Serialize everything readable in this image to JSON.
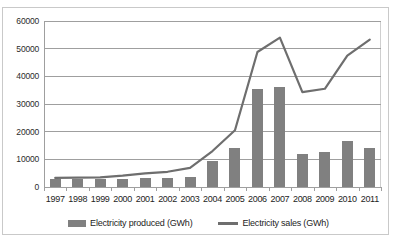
{
  "chart_data": {
    "type": "bar",
    "title": "",
    "xlabel": "",
    "ylabel": "",
    "ylim": [
      0,
      60000
    ],
    "ytick_step": 10000,
    "yticks": [
      "0",
      "10000",
      "20000",
      "30000",
      "40000",
      "50000",
      "60000"
    ],
    "grid": true,
    "legend_position": "bottom",
    "categories": [
      "1997",
      "1998",
      "1999",
      "2000",
      "2001",
      "2002",
      "2003",
      "2004",
      "2005",
      "2006",
      "2007",
      "2008",
      "2009",
      "2010",
      "2011"
    ],
    "series": [
      {
        "name": "Electricity produced (GWh)",
        "render": "bar",
        "color": "#808080",
        "values": [
          3000,
          2900,
          2900,
          3000,
          3100,
          3400,
          3500,
          9400,
          14000,
          35500,
          36000,
          11800,
          12800,
          16500,
          14100
        ]
      },
      {
        "name": "Electricity sales (GWh)",
        "render": "line",
        "color": "#6e6e6e",
        "values": [
          3300,
          3400,
          3500,
          4100,
          4900,
          5500,
          6900,
          13000,
          20500,
          48800,
          54000,
          34300,
          35500,
          47500,
          53300
        ]
      }
    ]
  },
  "legend": {
    "items": [
      {
        "label": "Electricity produced (GWh)",
        "swatch": "bar-swatch"
      },
      {
        "label": "Electricity sales (GWh)",
        "swatch": "line-swatch"
      }
    ]
  },
  "colors": {
    "bar": "#808080",
    "line": "#6e6e6e",
    "gridline": "#9f9f9f",
    "frame": "#c9c9c9",
    "text": "#1d1d1d",
    "background": "#ffffff"
  }
}
